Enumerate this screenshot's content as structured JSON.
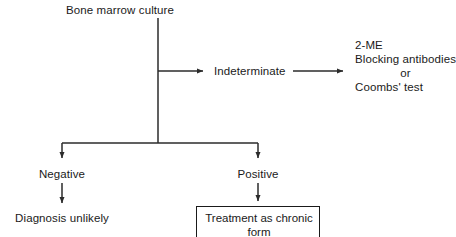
{
  "diagram": {
    "title": "Bone marrow culture",
    "colors": {
      "line": "#2b2b2b",
      "text": "#1a1a1a",
      "background": "#ffffff",
      "box_border": "#1a1a1a"
    },
    "nodes": {
      "root": "Bone marrow culture",
      "indeterminate": "Indeterminate",
      "negative": "Negative",
      "positive": "Positive",
      "diagnosis_unlikely": "Diagnosis unlikely"
    },
    "assay_block": {
      "line1": "2-ME",
      "line2": "Blocking antibodies",
      "line3": "or",
      "line4": "Coombs' test"
    },
    "treatment_box": {
      "line1": "Treatment as chronic",
      "line2": "form"
    }
  }
}
